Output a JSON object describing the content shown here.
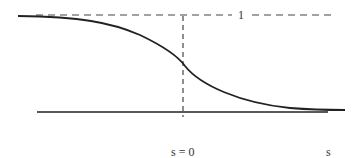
{
  "figure": {
    "labels": {
      "one": "1",
      "origin": "s = 0",
      "axis": "s"
    },
    "colors": {
      "line": "#222222",
      "dash": "#444444"
    }
  }
}
